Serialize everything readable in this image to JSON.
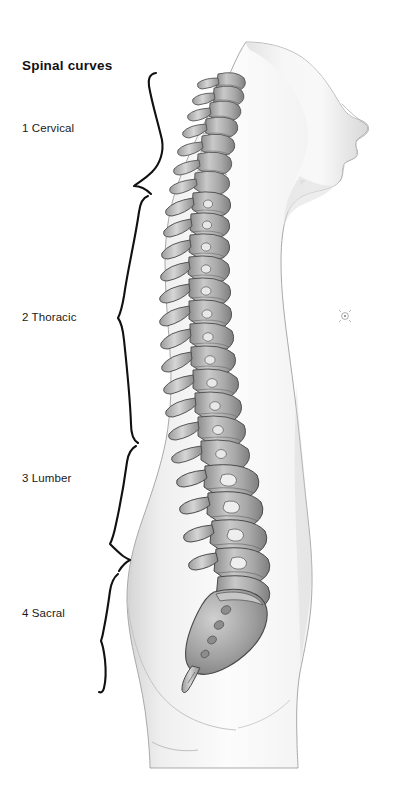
{
  "figure": {
    "title": "Spinal curves",
    "background_color": "#ffffff",
    "text_color": "#1a1a1a"
  },
  "labels": [
    {
      "id": "cervical",
      "number": "1",
      "name": "Cervical",
      "text": "1 Cervical"
    },
    {
      "id": "thoracic",
      "number": "2",
      "name": "Thoracic",
      "text": "2 Thoracic"
    },
    {
      "id": "lumber",
      "number": "3",
      "name": "Lumber",
      "text": "3 Lumber"
    },
    {
      "id": "sacral",
      "number": "4",
      "name": "Sacral",
      "text": "4 Sacral"
    }
  ],
  "braces": [
    {
      "id": "cervical-brace",
      "region": "Cervical",
      "top": 72,
      "bottom": 190,
      "tip_x": 133,
      "tip_y": 186
    },
    {
      "id": "thoracic-brace",
      "region": "Thoracic",
      "top": 192,
      "bottom": 440,
      "tip_x": 118,
      "tip_y": 318
    },
    {
      "id": "lumber-brace",
      "region": "Lumber",
      "top": 442,
      "bottom": 566,
      "tip_x": 128,
      "tip_y": 560
    },
    {
      "id": "sacral-brace",
      "region": "Sacral",
      "top": 568,
      "bottom": 692,
      "tip_x": 102,
      "tip_y": 640
    }
  ],
  "anatomy": {
    "body_fill_light": "#fbfbfb",
    "body_fill_mid": "#ededed",
    "body_fill_shade": "#d9d9d9",
    "outline_color": "#8a8a8a",
    "bone_fill": "#b9b9b9",
    "bone_light": "#e2e2e2",
    "bone_outline": "#4a4a4a",
    "nipple_marker": "nipple-detail",
    "parts": [
      "head",
      "face-profile",
      "neck",
      "torso",
      "buttock",
      "thigh",
      "cervical-vertebrae",
      "thoracic-vertebrae",
      "lumbar-vertebrae",
      "sacrum",
      "coccyx"
    ]
  },
  "vertebrae_counts": {
    "cervical": 7,
    "thoracic": 12,
    "lumbar": 5,
    "sacral": 5
  }
}
